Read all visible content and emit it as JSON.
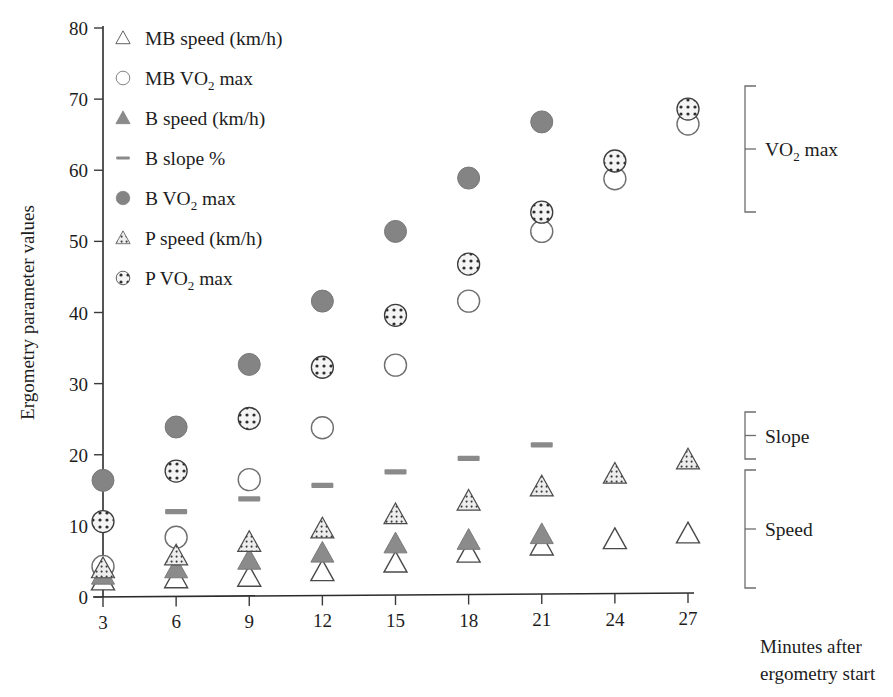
{
  "chart_data": {
    "type": "scatter",
    "title": "",
    "xlabel": "Minutes after ergometry start",
    "ylabel": "Ergometry parameter values",
    "x": [
      3,
      6,
      9,
      12,
      15,
      18,
      21,
      24,
      27
    ],
    "xtick_labels": [
      "3",
      "6",
      "9",
      "12",
      "15",
      "18",
      "21",
      "24",
      "27"
    ],
    "ytick_labels": [
      "0",
      "10",
      "20",
      "30",
      "40",
      "50",
      "60",
      "70",
      "80"
    ],
    "ytick_values": [
      0,
      10,
      20,
      30,
      40,
      50,
      60,
      70,
      80
    ],
    "xlim": [
      3,
      27
    ],
    "ylim": [
      0,
      80
    ],
    "grid": false,
    "legend_position": "upper-left-inside",
    "series": [
      {
        "name": "MB speed (km/h)",
        "key": "mb_speed",
        "marker": "open-triangle",
        "color": "#ffffff",
        "edge": "#4a4a4a",
        "values": [
          2.3,
          2.6,
          2.8,
          3.6,
          4.8,
          6.2,
          7.2,
          8.1,
          8.9
        ]
      },
      {
        "name": "MB VO2 max",
        "key": "mb_vo2max",
        "marker": "open-circle",
        "color": "#ffffff",
        "edge": "#6a6a6a",
        "values": [
          4.3,
          8.4,
          16.5,
          23.8,
          32.6,
          41.6,
          51.4,
          58.8,
          66.5
        ]
      },
      {
        "name": "B speed (km/h)",
        "key": "b_speed",
        "marker": "filled-triangle",
        "color": "#8b8b8b",
        "edge": "#6f6f6f",
        "values": [
          3.1,
          4.0,
          5.2,
          6.2,
          7.5,
          8.0,
          8.8,
          null,
          null
        ]
      },
      {
        "name": "B slope %",
        "key": "b_slope",
        "marker": "dash",
        "color": "#8a8a8a",
        "edge": "#8a8a8a",
        "values": [
          null,
          12.0,
          13.8,
          15.7,
          17.6,
          19.5,
          21.4,
          null,
          null
        ]
      },
      {
        "name": "B VO2 max",
        "key": "b_vo2max",
        "marker": "filled-circle",
        "color": "#848484",
        "edge": "#707070",
        "values": [
          16.4,
          23.9,
          32.7,
          41.6,
          51.4,
          58.9,
          66.8,
          null,
          null
        ]
      },
      {
        "name": "P speed (km/h)",
        "key": "p_speed",
        "marker": "dotted-triangle",
        "color": "#e6e6e6",
        "edge": "#4a4a4a",
        "values": [
          4.0,
          5.8,
          7.7,
          9.6,
          11.6,
          13.5,
          15.5,
          17.3,
          19.3
        ]
      },
      {
        "name": "P VO2 max",
        "key": "p_vo2max",
        "marker": "dotted-circle",
        "color": "#f2f2f2",
        "edge": "#3c3c3c",
        "values": [
          10.6,
          17.7,
          25.1,
          32.3,
          39.6,
          46.8,
          54.1,
          61.3,
          68.6
        ]
      }
    ],
    "annotations": [
      {
        "label": "VO₂ max",
        "key": "vo2max",
        "y_range": [
          21,
          80
        ]
      },
      {
        "label": "Slope",
        "key": "slope",
        "y_range": [
          19,
          25
        ]
      },
      {
        "label": "Speed",
        "key": "speed",
        "y_range": [
          2,
          20
        ]
      }
    ]
  },
  "legend": {
    "items": [
      {
        "label_plain": "MB speed (km/h)",
        "pre": "MB speed (km/h)",
        "sub": "",
        "post": "",
        "marker": "open-triangle"
      },
      {
        "label_plain": "MB VO2 max",
        "pre": "MB VO",
        "sub": "2",
        "post": " max",
        "marker": "open-circle"
      },
      {
        "label_plain": "B speed (km/h)",
        "pre": "B speed (km/h)",
        "sub": "",
        "post": "",
        "marker": "filled-triangle"
      },
      {
        "label_plain": "B slope %",
        "pre": "B slope %",
        "sub": "",
        "post": "",
        "marker": "dash"
      },
      {
        "label_plain": "B VO2 max",
        "pre": "B VO",
        "sub": "2",
        "post": " max",
        "marker": "filled-circle"
      },
      {
        "label_plain": "P speed (km/h)",
        "pre": "P speed (km/h)",
        "sub": "",
        "post": "",
        "marker": "dotted-triangle"
      },
      {
        "label_plain": "P VO2 max",
        "pre": "P VO",
        "sub": "2",
        "post": " max",
        "marker": "dotted-circle"
      }
    ]
  },
  "axes": {
    "y_title": "Ergometry parameter values",
    "x_title_line1": "Minutes after",
    "x_title_line2": "ergometry start",
    "x_ticks": [
      "3",
      "6",
      "9",
      "12",
      "15",
      "18",
      "21",
      "24",
      "27"
    ],
    "y_ticks": [
      "0",
      "10",
      "20",
      "30",
      "40",
      "50",
      "60",
      "70",
      "80"
    ]
  },
  "brackets": {
    "vo2max": {
      "pre": "VO",
      "sub": "2",
      "post": " max"
    },
    "slope": {
      "label": "Slope"
    },
    "speed": {
      "label": "Speed"
    }
  },
  "colors": {
    "axis": "#2b2b2b",
    "text": "#1c1c1c",
    "bracket": "#6d6d6d",
    "gray_fill": "#848484",
    "gray_edge": "#6f6f6f"
  }
}
